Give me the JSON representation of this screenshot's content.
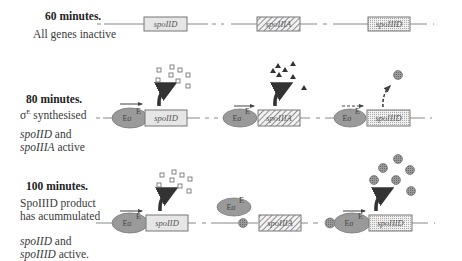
{
  "rows": [
    {
      "time": "60 minutes.",
      "desc": "All genes inactive",
      "desc2": "",
      "active_lines": []
    },
    {
      "time": "80 minutes.",
      "desc_sigma": "σ",
      "desc_sup": "E",
      "desc_rest": " synthesised",
      "active_gene1": "spoIID",
      "active_and": " and",
      "active_gene2": "spoIIIA",
      "active_tail": " active"
    },
    {
      "time": "100 minutes.",
      "desc_line1": "SpoIIID product",
      "desc_line2": "has acummulated",
      "active_gene1": "spoIID",
      "active_and": " and",
      "active_gene2": "spoIIID",
      "active_tail": " active."
    }
  ],
  "genes": {
    "g1": "spoIID",
    "g2": "spoIIIA",
    "g3": "spoIIID"
  },
  "rnap": {
    "label": "Eσ",
    "sup": "E"
  },
  "colors": {
    "box_fill": "#e6e6e6",
    "box_stroke": "#777777",
    "rnap_fill": "#9a9a9a",
    "line": "#888888",
    "arrow": "#333333",
    "product_fill": "#888888"
  }
}
